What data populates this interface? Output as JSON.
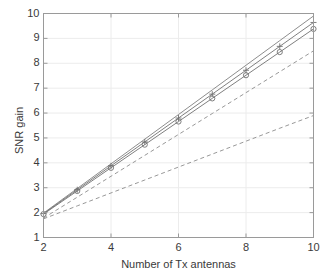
{
  "chart_data": {
    "type": "line",
    "title": "",
    "xlabel": "Number of Tx antennas",
    "ylabel": "SNR gain",
    "xlim": [
      2,
      10
    ],
    "ylim": [
      1,
      10
    ],
    "xticks": [
      2,
      4,
      6,
      8,
      10
    ],
    "yticks": [
      1,
      2,
      3,
      4,
      5,
      6,
      7,
      8,
      9,
      10
    ],
    "xtick_labels": [
      "2",
      "4",
      "6",
      "8",
      "10"
    ],
    "ytick_labels": [
      "1",
      "2",
      "3",
      "4",
      "5",
      "6",
      "7",
      "8",
      "9",
      "10"
    ],
    "grid": true,
    "legend": "none",
    "x": [
      2,
      3,
      4,
      5,
      6,
      7,
      8,
      9,
      10
    ],
    "series": [
      {
        "name": "upper-bound-solid",
        "style": "solid",
        "marker": "none",
        "color": "#808080",
        "values": [
          1.98,
          2.97,
          3.96,
          4.95,
          5.94,
          6.93,
          7.92,
          8.91,
          9.9
        ]
      },
      {
        "name": "solid-plus-marker",
        "style": "solid",
        "marker": "plus",
        "color": "#707070",
        "values": [
          1.96,
          2.92,
          3.88,
          4.84,
          5.8,
          6.76,
          7.72,
          8.68,
          9.64
        ]
      },
      {
        "name": "solid-circle-marker",
        "style": "solid",
        "marker": "circle",
        "color": "#707070",
        "values": [
          1.94,
          2.87,
          3.8,
          4.73,
          5.66,
          6.59,
          7.52,
          8.45,
          9.38
        ]
      },
      {
        "name": "dashed-upper",
        "style": "dashed",
        "marker": "none",
        "color": "#8c8c8c",
        "values": [
          1.78,
          2.62,
          3.46,
          4.3,
          5.14,
          5.98,
          6.82,
          7.66,
          8.5
        ]
      },
      {
        "name": "dashed-lower",
        "style": "dashed",
        "marker": "none",
        "color": "#8c8c8c",
        "values": [
          1.75,
          2.27,
          2.79,
          3.31,
          3.83,
          4.35,
          4.87,
          5.39,
          5.9
        ]
      }
    ]
  },
  "axes": {
    "frame_color": "#9a9a9a",
    "grid_color": "#ececec",
    "text_color": "#3a3a3a"
  }
}
